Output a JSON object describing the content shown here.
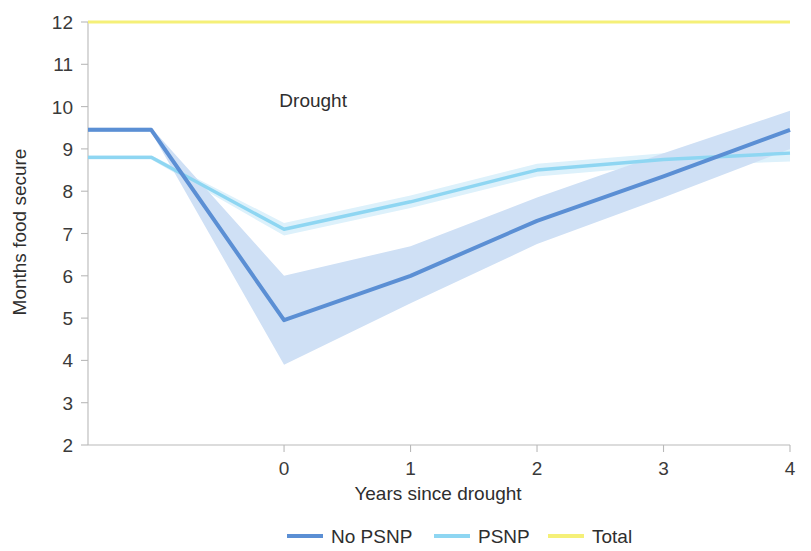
{
  "chart_data": {
    "type": "line",
    "title": "",
    "xlabel": "Years since drought",
    "ylabel": "Months food secure",
    "xlim": [
      -1.55,
      4
    ],
    "ylim": [
      2,
      12
    ],
    "xticks": [
      0,
      1,
      2,
      3,
      4
    ],
    "yticks": [
      2,
      3,
      4,
      5,
      6,
      7,
      8,
      9,
      10,
      11,
      12
    ],
    "grid": false,
    "legend_position": "bottom",
    "annotations": [
      {
        "text": "Drought",
        "x": 0.23,
        "y": 10.0
      }
    ],
    "series": [
      {
        "name": "No PSNP",
        "color": "#5b8fd4",
        "band_color": "#cfe0f5",
        "x": [
          -1.55,
          -1.05,
          0,
          1,
          2,
          3,
          4
        ],
        "values": [
          9.45,
          9.45,
          4.95,
          6.0,
          7.3,
          8.35,
          9.45
        ],
        "band_lower": [
          9.4,
          9.4,
          3.9,
          5.35,
          6.75,
          7.85,
          9.0
        ],
        "band_upper": [
          9.5,
          9.5,
          6.0,
          6.7,
          7.85,
          8.9,
          9.9
        ]
      },
      {
        "name": "PSNP",
        "color": "#8ed6f2",
        "band_color": "#ddf1fb",
        "x": [
          -1.55,
          -1.05,
          0,
          1,
          2,
          3,
          4
        ],
        "values": [
          8.8,
          8.8,
          7.1,
          7.75,
          8.5,
          8.75,
          8.9
        ],
        "band_lower": [
          8.75,
          8.75,
          6.95,
          7.6,
          8.35,
          8.6,
          8.7
        ],
        "band_upper": [
          8.85,
          8.85,
          7.25,
          7.9,
          8.65,
          8.9,
          9.1
        ]
      },
      {
        "name": "Total",
        "color": "#f5f078",
        "band_color": "none",
        "x": [
          -1.55,
          4
        ],
        "values": [
          12,
          12
        ],
        "band_lower": [
          12,
          12
        ],
        "band_upper": [
          12,
          12
        ]
      }
    ]
  },
  "legend": {
    "items": [
      {
        "label": "No PSNP",
        "color": "#5b8fd4"
      },
      {
        "label": "PSNP",
        "color": "#8ed6f2"
      },
      {
        "label": "Total",
        "color": "#f5f078"
      }
    ]
  }
}
